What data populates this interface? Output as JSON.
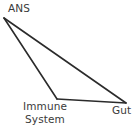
{
  "diagram": {
    "type": "triangle-relationship-diagram",
    "background_color": "#ffffff",
    "line_color": "#2b2b2b",
    "text_color": "#3a3a3a",
    "nodes": [
      {
        "id": "ans",
        "label": "ANS",
        "vertex": {
          "x": 4,
          "y": 18
        },
        "label_position": {
          "x": 8,
          "y": 2
        }
      },
      {
        "id": "immune-system",
        "label_line1": "Immune",
        "label_line2": "System",
        "label_full": "Immune System",
        "vertex": {
          "x": 57,
          "y": 99
        },
        "label_position": {
          "x": 21,
          "y": 100
        }
      },
      {
        "id": "gut",
        "label": "Gut",
        "vertex": {
          "x": 126,
          "y": 103
        },
        "label_position": {
          "x": 112,
          "y": 104
        }
      }
    ],
    "edges": [
      {
        "from": "ans",
        "to": "gut"
      },
      {
        "from": "ans",
        "to": "immune-system"
      },
      {
        "from": "immune-system",
        "to": "gut"
      }
    ]
  }
}
